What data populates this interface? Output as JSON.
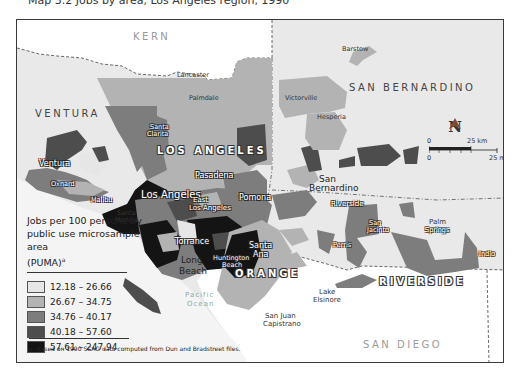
{
  "caption_top": "Map 3.2 Jobs by area, Los Angeles region, 1990",
  "map": {
    "counties": {
      "kern": "KERN",
      "ventura": "VENTURA",
      "los_angeles": "LOS ANGELES",
      "san_bernardino": "SAN BERNARDINO",
      "riverside": "RIVERSIDE",
      "orange": "ORANGE",
      "san_diego": "SAN DIEGO"
    },
    "cities": {
      "barstow": "Barstow",
      "lancaster": "Lancaster",
      "palmdale": "Palmdale",
      "victorville": "Victorville",
      "hesperia": "Hesperia",
      "santa_clarita_1": "Santa",
      "santa_clarita_2": "Clarita",
      "ventura": "Ventura",
      "oxnard": "Oxnard",
      "malibu": "Malibu",
      "santa_monica_1": "Santa",
      "santa_monica_2": "Monica",
      "los_angeles": "Los Angeles",
      "pasadena": "Pasadena",
      "east_la_1": "East",
      "east_la_2": "Los Angeles",
      "pomona": "Pomona",
      "san_bernardino_1": "San",
      "san_bernardino_2": "Bernardino",
      "riverside": "Riverside",
      "torrance": "Torrance",
      "long_beach_1": "Long",
      "long_beach_2": "Beach",
      "huntington_1": "Huntington",
      "huntington_2": "Beach",
      "santa_ana_1": "Santa",
      "santa_ana_2": "Ana",
      "perris": "Perris",
      "san_jacinto_1": "San",
      "san_jacinto_2": "Jacinto",
      "palm_springs_1": "Palm",
      "palm_springs_2": "Springs",
      "indio": "Indio",
      "lake_elsinore_1": "Lake",
      "lake_elsinore_2": "Elsinore",
      "san_juan_1": "San Juan",
      "san_juan_2": "Capistrano"
    },
    "ocean_1": "Pacific",
    "ocean_2": "Ocean",
    "north_label": "N",
    "scale": {
      "km_zero": "0",
      "km_label": "25 km",
      "mi_zero": "0",
      "mi_label": "25 mi"
    }
  },
  "legend": {
    "title_line1": "Jobs per 100 persons by",
    "title_line2": "public use microsample area",
    "title_line3": "(PUMA)",
    "title_sup": "a",
    "items": [
      {
        "range": "12.18 – 26.66",
        "color": "#e6e6e6"
      },
      {
        "range": "26.67 – 34.75",
        "color": "#b3b3b3"
      },
      {
        "range": "34.76 – 40.17",
        "color": "#7d7d7d"
      },
      {
        "range": "40.18 – 57.60",
        "color": "#4d4d4d"
      },
      {
        "range": "57.61 – 247.94",
        "color": "#141414"
      }
    ]
  },
  "footnote": "a. Based on 1990 SCAG data computed from Dun and Bradstreet files.",
  "colors": {
    "background_land": "#e9e9e9",
    "outside_region": "#ffffff",
    "ocean": "#f2f2f2",
    "border": "#3a3a3a"
  }
}
